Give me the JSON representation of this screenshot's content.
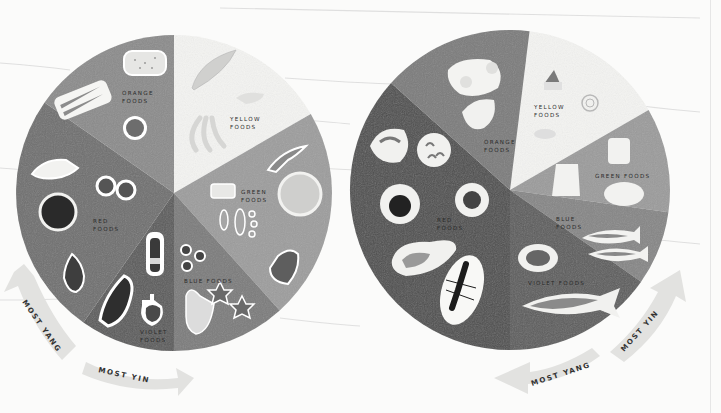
{
  "diagram": {
    "type": "two-color-wheels",
    "style": "grayscale watercolor illustration",
    "wheels": [
      {
        "id": "left",
        "segments": [
          {
            "key": "yellow",
            "label": [
              "YELLOW",
              "FOODS"
            ],
            "shade": "#f3f3f1",
            "foods": [
              "squash",
              "butter",
              "bananas"
            ]
          },
          {
            "key": "green",
            "label": [
              "GREEN",
              "FOODS"
            ],
            "shade": "#9c9c9c",
            "foods": [
              "kale leaf",
              "tofu",
              "cabbage",
              "pea pods",
              "bell pepper"
            ]
          },
          {
            "key": "blue",
            "label": [
              "BLUE FOODS"
            ],
            "shade": "#7b7b7b",
            "foods": [
              "blueberries",
              "shiitake mushroom",
              "star anise"
            ]
          },
          {
            "key": "violet",
            "label": [
              "VIOLET",
              "FOODS"
            ],
            "shade": "#5a5a5a",
            "foods": [
              "soy sauce bottle",
              "eggplant",
              "vinegar bottle"
            ]
          },
          {
            "key": "red",
            "label": [
              "RED",
              "FOODS"
            ],
            "shade": "#6e6e6e",
            "foods": [
              "red radish",
              "tomatoes",
              "red cabbage",
              "onion"
            ]
          },
          {
            "key": "orange",
            "label": [
              "ORANGE",
              "FOODS"
            ],
            "shade": "#8a8a8a",
            "foods": [
              "grains",
              "carrots",
              "orange"
            ]
          }
        ],
        "arrows": [
          {
            "label": "MOST YANG",
            "direction": "counter-clockwise"
          },
          {
            "label": "MOST YIN",
            "direction": "clockwise"
          }
        ]
      },
      {
        "id": "right",
        "segments": [
          {
            "key": "yellow",
            "label": [
              "YELLOW",
              "FOODS"
            ],
            "shade": "#f3f3f1",
            "foods": [
              "cake slice",
              "spiral pastry",
              "cheese"
            ]
          },
          {
            "key": "green",
            "label": [
              "GREEN FOODS"
            ],
            "shade": "#9a9a9a",
            "foods": [
              "glass of milk",
              "yogurt cup",
              "cheese wheel"
            ]
          },
          {
            "key": "blue",
            "label": [
              "BLUE",
              "FOODS"
            ],
            "shade": "#858585",
            "foods": [
              "fish fillets"
            ]
          },
          {
            "key": "violet",
            "label": [
              "VIOLET FOODS"
            ],
            "shade": "#5c5c5c",
            "foods": [
              "oyster",
              "whole fish"
            ]
          },
          {
            "key": "red",
            "label": [
              "RED",
              "FOODS"
            ],
            "shade": "#4e4e4e",
            "foods": [
              "shrimp",
              "shrimp plate",
              "crab",
              "seaweed roll",
              "steak",
              "lobster"
            ]
          },
          {
            "key": "orange",
            "label": [
              "ORANGE",
              "FOODS"
            ],
            "shade": "#7a7a7a",
            "foods": [
              "fried eggs",
              "egg yolk"
            ]
          }
        ],
        "arrows": [
          {
            "label": "MOST YIN",
            "direction": "counter-clockwise"
          },
          {
            "label": "MOST YANG",
            "direction": "clockwise"
          }
        ]
      }
    ]
  },
  "text": {
    "left_arrow_yang": "MOST YANG",
    "left_arrow_yin": "MOST YIN",
    "right_arrow_yin": "MOST YIN",
    "right_arrow_yang": "MOST YANG",
    "left_yellow_1": "YELLOW",
    "left_yellow_2": "FOODS",
    "left_orange_1": "ORANGE",
    "left_orange_2": "FOODS",
    "left_green_1": "GREEN",
    "left_green_2": "FOODS",
    "left_blue": "BLUE FOODS",
    "left_violet_1": "VIOLET",
    "left_violet_2": "FOODS",
    "left_red_1": "RED",
    "left_red_2": "FOODS",
    "right_yellow_1": "YELLOW",
    "right_yellow_2": "FOODS",
    "right_orange_1": "ORANGE",
    "right_orange_2": "FOODS",
    "right_green": "GREEN FOODS",
    "right_blue_1": "BLUE",
    "right_blue_2": "FOODS",
    "right_violet": "VIOLET FOODS",
    "right_red_1": "RED",
    "right_red_2": "FOODS"
  }
}
